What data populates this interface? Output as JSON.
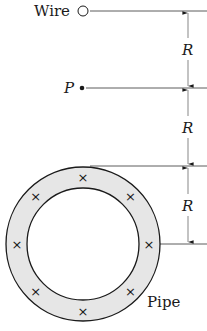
{
  "diagram": {
    "type": "physics-figure",
    "labels": {
      "wire": "Wire",
      "point": "P",
      "pipe": "Pipe",
      "dim1": "R",
      "dim2": "R",
      "dim3": "R"
    },
    "current_marker": "×",
    "colors": {
      "ink": "#1a1a1a",
      "pipe_fill": "#e6e6e6",
      "background": "#ffffff"
    }
  }
}
